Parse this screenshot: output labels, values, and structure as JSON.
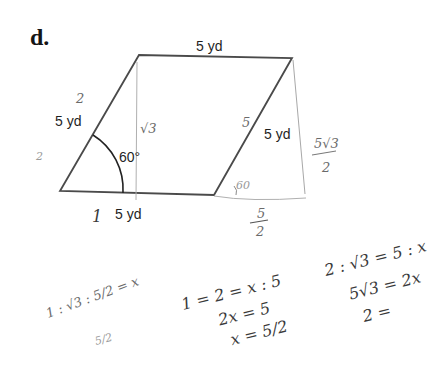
{
  "problem_label": "d.",
  "figure": {
    "shape": "parallelogram",
    "sides": {
      "top": "5 yd",
      "left": "5 yd",
      "right": "5 yd",
      "bottom": "5 yd"
    },
    "angle": "60°",
    "stroke_color": "#4a4a4a"
  },
  "annotations": {
    "left_side_mark": "2",
    "left_outside_mark": "2",
    "height_mark": "√3",
    "right_side_mark": "5",
    "exterior_angle": "60",
    "right_height": "5√3",
    "right_height_den": "2",
    "bottom_ext": "5",
    "bottom_ext_den": "2",
    "bottom_mark": "1"
  },
  "work": {
    "left_eq": "1 : √3 : 5/2 = x",
    "left_sub": "5/2",
    "middle_eq1": "1 = 2 = x : 5",
    "middle_eq2": "2x = 5",
    "middle_eq3": "x = 5/2",
    "right_eq1": "2 : √3 = 5 : x",
    "right_eq2": "5√3 = 2x",
    "right_eq3": "2 ="
  }
}
